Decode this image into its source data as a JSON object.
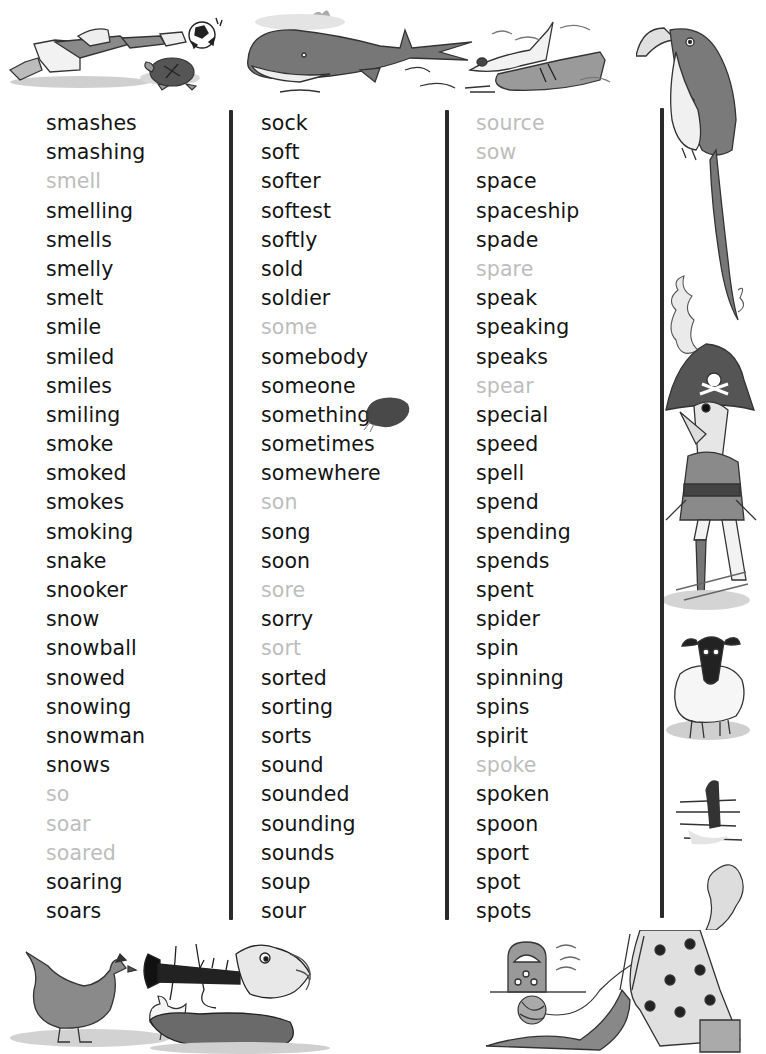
{
  "word_list": {
    "columns": [
      {
        "words": [
          {
            "text": "smashes",
            "dim": false
          },
          {
            "text": "smashing",
            "dim": false
          },
          {
            "text": "smell",
            "dim": true
          },
          {
            "text": "smelling",
            "dim": false
          },
          {
            "text": "smells",
            "dim": false
          },
          {
            "text": "smelly",
            "dim": false
          },
          {
            "text": "smelt",
            "dim": false
          },
          {
            "text": "smile",
            "dim": false
          },
          {
            "text": "smiled",
            "dim": false
          },
          {
            "text": "smiles",
            "dim": false
          },
          {
            "text": "smiling",
            "dim": false
          },
          {
            "text": "smoke",
            "dim": false
          },
          {
            "text": "smoked",
            "dim": false
          },
          {
            "text": "smokes",
            "dim": false
          },
          {
            "text": "smoking",
            "dim": false
          },
          {
            "text": "snake",
            "dim": false
          },
          {
            "text": "snooker",
            "dim": false
          },
          {
            "text": "snow",
            "dim": false
          },
          {
            "text": "snowball",
            "dim": false
          },
          {
            "text": "snowed",
            "dim": false
          },
          {
            "text": "snowing",
            "dim": false
          },
          {
            "text": "snowman",
            "dim": false
          },
          {
            "text": "snows",
            "dim": false
          },
          {
            "text": "so",
            "dim": true
          },
          {
            "text": "soar",
            "dim": true
          },
          {
            "text": "soared",
            "dim": true
          },
          {
            "text": "soaring",
            "dim": false
          },
          {
            "text": "soars",
            "dim": false
          }
        ]
      },
      {
        "words": [
          {
            "text": "sock",
            "dim": false
          },
          {
            "text": "soft",
            "dim": false
          },
          {
            "text": "softer",
            "dim": false
          },
          {
            "text": "softest",
            "dim": false
          },
          {
            "text": "softly",
            "dim": false
          },
          {
            "text": "sold",
            "dim": false
          },
          {
            "text": "soldier",
            "dim": false
          },
          {
            "text": "some",
            "dim": true
          },
          {
            "text": "somebody",
            "dim": false
          },
          {
            "text": "someone",
            "dim": false
          },
          {
            "text": "something",
            "dim": false
          },
          {
            "text": "sometimes",
            "dim": false
          },
          {
            "text": "somewhere",
            "dim": false
          },
          {
            "text": "son",
            "dim": true
          },
          {
            "text": "song",
            "dim": false
          },
          {
            "text": "soon",
            "dim": false
          },
          {
            "text": "sore",
            "dim": true
          },
          {
            "text": "sorry",
            "dim": false
          },
          {
            "text": "sort",
            "dim": true
          },
          {
            "text": "sorted",
            "dim": false
          },
          {
            "text": "sorting",
            "dim": false
          },
          {
            "text": "sorts",
            "dim": false
          },
          {
            "text": "sound",
            "dim": false
          },
          {
            "text": "sounded",
            "dim": false
          },
          {
            "text": "sounding",
            "dim": false
          },
          {
            "text": "sounds",
            "dim": false
          },
          {
            "text": "soup",
            "dim": false
          },
          {
            "text": "sour",
            "dim": false
          }
        ]
      },
      {
        "words": [
          {
            "text": "source",
            "dim": true
          },
          {
            "text": "sow",
            "dim": true
          },
          {
            "text": "space",
            "dim": false
          },
          {
            "text": "spaceship",
            "dim": false
          },
          {
            "text": "spade",
            "dim": false
          },
          {
            "text": "spare",
            "dim": true
          },
          {
            "text": "speak",
            "dim": false
          },
          {
            "text": "speaking",
            "dim": false
          },
          {
            "text": "speaks",
            "dim": false
          },
          {
            "text": "spear",
            "dim": true
          },
          {
            "text": "special",
            "dim": false
          },
          {
            "text": "speed",
            "dim": false
          },
          {
            "text": "spell",
            "dim": false
          },
          {
            "text": "spend",
            "dim": false
          },
          {
            "text": "spending",
            "dim": false
          },
          {
            "text": "spends",
            "dim": false
          },
          {
            "text": "spent",
            "dim": false
          },
          {
            "text": "spider",
            "dim": false
          },
          {
            "text": "spin",
            "dim": false
          },
          {
            "text": "spinning",
            "dim": false
          },
          {
            "text": "spins",
            "dim": false
          },
          {
            "text": "spirit",
            "dim": false
          },
          {
            "text": "spoke",
            "dim": true
          },
          {
            "text": "spoken",
            "dim": false
          },
          {
            "text": "spoon",
            "dim": false
          },
          {
            "text": "sport",
            "dim": false
          },
          {
            "text": "spot",
            "dim": false
          },
          {
            "text": "spots",
            "dim": false
          }
        ]
      }
    ]
  },
  "colors": {
    "word_active": "#141414",
    "word_dim": "#bdbdbd",
    "divider": "#2a2a2a"
  },
  "illustrations": {
    "top": [
      "goalkeeper-diving",
      "football",
      "tortoise",
      "whale",
      "high-heel-shoe",
      "lace-up-shoe",
      "parrot"
    ],
    "right": [
      "parrot-tail",
      "smoke",
      "pirate",
      "sheep",
      "sea-serpent"
    ],
    "bottom": [
      "hen",
      "chick",
      "clarinet-player",
      "radio",
      "ball-of-wool",
      "knitting-woman"
    ]
  }
}
